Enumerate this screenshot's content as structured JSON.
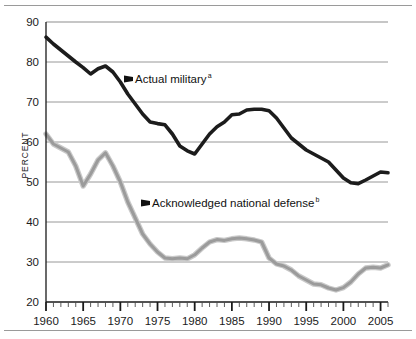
{
  "chart_data": {
    "type": "line",
    "title": "",
    "xlabel": "",
    "ylabel": "PERCENT",
    "xlim": [
      1960,
      2006
    ],
    "ylim": [
      20,
      90
    ],
    "ytick_values": [
      20,
      30,
      40,
      50,
      60,
      70,
      80,
      90
    ],
    "ytick_labels": [
      "20",
      "30",
      "40",
      "50",
      "60",
      "70",
      "80",
      "90"
    ],
    "xtick_labels": [
      "1960",
      "1965",
      "1970",
      "1975",
      "1980",
      "1985",
      "1990",
      "1995",
      "2000",
      "2005"
    ],
    "xtick_values": [
      1960,
      1965,
      1970,
      1975,
      1980,
      1985,
      1990,
      1995,
      2000,
      2005
    ],
    "minor_tick_interval": 1,
    "grid": "horizontal",
    "legend": "inline-annotations",
    "series": [
      {
        "name": "Actual military",
        "footnote": "a",
        "color": "#1c1c1c",
        "x": [
          1960,
          1961,
          1962,
          1963,
          1964,
          1965,
          1966,
          1967,
          1968,
          1969,
          1970,
          1971,
          1972,
          1973,
          1974,
          1975,
          1976,
          1977,
          1978,
          1979,
          1980,
          1981,
          1982,
          1983,
          1984,
          1985,
          1986,
          1987,
          1988,
          1989,
          1990,
          1991,
          1992,
          1993,
          1994,
          1995,
          1996,
          1997,
          1998,
          1999,
          2000,
          2001,
          2002,
          2003,
          2004,
          2005,
          2006
        ],
        "values": [
          86.2,
          84.5,
          83.0,
          81.5,
          80.0,
          78.6,
          77.0,
          78.3,
          79.0,
          77.5,
          75.0,
          72.0,
          69.5,
          67.0,
          65.0,
          64.6,
          64.3,
          62.0,
          59.0,
          57.8,
          57.0,
          59.5,
          62.0,
          63.8,
          65.0,
          66.8,
          67.0,
          68.0,
          68.2,
          68.2,
          67.8,
          66.0,
          63.5,
          61.0,
          59.5,
          58.0,
          57.0,
          56.0,
          55.0,
          53.0,
          51.0,
          49.8,
          49.6,
          50.5,
          51.5,
          52.5,
          52.3
        ]
      },
      {
        "name": "Acknowledged national defense",
        "footnote": "b",
        "color": "#9b9b9b",
        "x": [
          1960,
          1961,
          1962,
          1963,
          1964,
          1965,
          1966,
          1967,
          1968,
          1969,
          1970,
          1971,
          1972,
          1973,
          1974,
          1975,
          1976,
          1977,
          1978,
          1979,
          1980,
          1981,
          1982,
          1983,
          1984,
          1985,
          1986,
          1987,
          1988,
          1989,
          1990,
          1991,
          1992,
          1993,
          1994,
          1995,
          1996,
          1997,
          1998,
          1999,
          2000,
          2001,
          2002,
          2003,
          2004,
          2005,
          2006
        ],
        "values": [
          62.0,
          59.5,
          58.5,
          57.5,
          54.0,
          49.0,
          52.0,
          55.5,
          57.3,
          54.0,
          50.0,
          45.0,
          41.0,
          37.0,
          34.5,
          32.5,
          31.0,
          30.8,
          31.0,
          30.8,
          31.8,
          33.5,
          35.0,
          35.6,
          35.4,
          35.8,
          36.0,
          35.8,
          35.5,
          35.0,
          31.0,
          29.5,
          29.0,
          28.0,
          26.5,
          25.5,
          24.5,
          24.3,
          23.5,
          23.0,
          23.6,
          25.0,
          27.0,
          28.5,
          28.7,
          28.5,
          29.3
        ]
      }
    ],
    "annotations": [
      {
        "id": "actual-military-annotation",
        "label": "Actual military",
        "footnote": "a",
        "arrow": "left"
      },
      {
        "id": "acknowledged-defense-annotation",
        "label": "Acknowledged national defense",
        "footnote": "b",
        "arrow": "left"
      }
    ]
  }
}
